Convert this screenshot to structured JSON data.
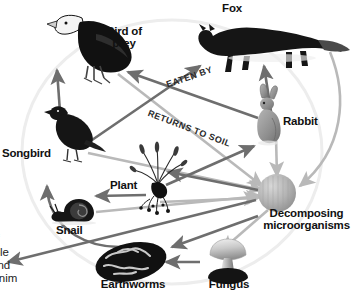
{
  "diagram": {
    "nodes": [
      {
        "id": "bird-of-prey",
        "label": "Bird of\nprey",
        "x": 124,
        "y": 37,
        "font": 11.5
      },
      {
        "id": "fox",
        "label": "Fox",
        "x": 232,
        "y": 10,
        "font": 11.5
      },
      {
        "id": "rabbit",
        "label": "Rabbit",
        "x": 307,
        "y": 124,
        "font": 11.5
      },
      {
        "id": "songbird",
        "label": "Songbird",
        "x": 36,
        "y": 155,
        "font": 11.5
      },
      {
        "id": "plant",
        "label": "Plant",
        "x": 128,
        "y": 187,
        "font": 11.5
      },
      {
        "id": "snail",
        "label": "Snail",
        "x": 74,
        "y": 228,
        "font": 11.5
      },
      {
        "id": "earthworms",
        "label": "Earthworms",
        "x": 133,
        "y": 286,
        "font": 11.5
      },
      {
        "id": "fungus",
        "label": "Fungus",
        "x": 228,
        "y": 285,
        "font": 11.5
      },
      {
        "id": "decomposers",
        "label": "Decomposing\nmicroorganisms",
        "x": 303,
        "y": 222,
        "font": 11.5
      }
    ],
    "flow_labels": [
      {
        "id": "eaten-by",
        "text": "EATEN BY",
        "x": 177,
        "y": 82,
        "rotate": -19
      },
      {
        "id": "returns-to-soil",
        "text": "RETURNS TO SOIL",
        "x": 161,
        "y": 112,
        "rotate": 21
      }
    ],
    "body_text": "are no\nnd how\number of\nains stable\nlimate, and\nof prey anim",
    "colors": {
      "background": "#ffffff",
      "arrow_eaten_by": "#6e6e6e",
      "arrow_returns_to_soil": "#b9b9b9",
      "node_dark": "#111111",
      "node_mid": "#8c8c8c",
      "node_light": "#d5d5d5",
      "ring": "#ededed",
      "label_text": "#111111"
    }
  }
}
